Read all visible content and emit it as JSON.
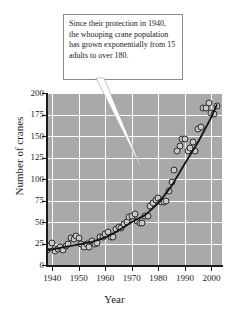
{
  "chart_data": {
    "type": "scatter",
    "title": "",
    "xlabel": "Year",
    "ylabel": "Number of cranes",
    "xlim": [
      1938,
      2004
    ],
    "ylim": [
      0,
      200
    ],
    "xticks": [
      1940,
      1950,
      1960,
      1970,
      1980,
      1990,
      2000
    ],
    "yticks": [
      0,
      25,
      50,
      75,
      100,
      125,
      150,
      175,
      200
    ],
    "grid": true,
    "legend": null,
    "series": [
      {
        "name": "Whooping crane population",
        "marker": "open-circle",
        "x": [
          1938,
          1939,
          1940,
          1941,
          1942,
          1943,
          1944,
          1945,
          1946,
          1947,
          1948,
          1949,
          1950,
          1951,
          1952,
          1953,
          1954,
          1955,
          1956,
          1957,
          1958,
          1959,
          1960,
          1961,
          1962,
          1963,
          1964,
          1965,
          1966,
          1967,
          1968,
          1969,
          1970,
          1971,
          1972,
          1973,
          1974,
          1975,
          1976,
          1977,
          1978,
          1979,
          1980,
          1981,
          1982,
          1983,
          1984,
          1985,
          1986,
          1987,
          1988,
          1989,
          1990,
          1991,
          1992,
          1993,
          1994,
          1995,
          1996,
          1997,
          1998,
          1999,
          2000,
          2001,
          2002
        ],
        "y": [
          18,
          22,
          26,
          16,
          19,
          21,
          18,
          22,
          25,
          31,
          30,
          34,
          31,
          25,
          21,
          24,
          21,
          28,
          24,
          26,
          32,
          33,
          36,
          38,
          32,
          33,
          42,
          44,
          43,
          48,
          50,
          56,
          57,
          59,
          51,
          49,
          49,
          57,
          57,
          69,
          72,
          76,
          78,
          73,
          73,
          75,
          86,
          97,
          110,
          132,
          138,
          146,
          146,
          132,
          136,
          143,
          133,
          158,
          160,
          182,
          183,
          188,
          177,
          176,
          185
        ]
      },
      {
        "name": "Exponential model fit",
        "type": "line",
        "x": [
          1938,
          1945,
          1950,
          1955,
          1960,
          1965,
          1970,
          1975,
          1980,
          1985,
          1990,
          1995,
          2000,
          2002
        ],
        "y": [
          17,
          21,
          24,
          27,
          32,
          40,
          50,
          58,
          72,
          92,
          118,
          143,
          172,
          186
        ]
      }
    ]
  },
  "callout": {
    "text": "Since their protection in 1940, the whooping crane population has grown exponentially from 15 adults to over 180."
  }
}
